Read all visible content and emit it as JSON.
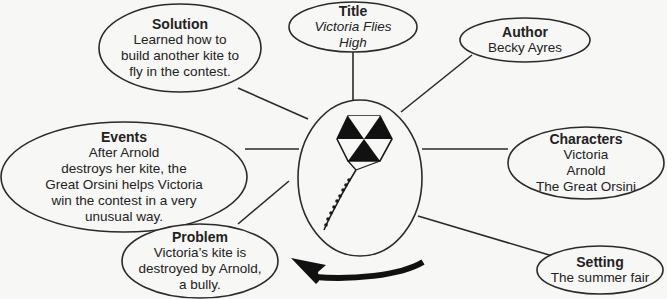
{
  "diagram": {
    "type": "story-map",
    "colors": {
      "stroke": "#2a2a2a",
      "background": "#f7f7f5",
      "text": "#222222"
    },
    "center": {
      "icon": "kite-icon"
    },
    "nodes": {
      "title": {
        "heading": "Title",
        "body": "Victoria Flies\nHigh"
      },
      "author": {
        "heading": "Author",
        "body": "Becky Ayres"
      },
      "solution": {
        "heading": "Solution",
        "body": "Learned how to\nbuild another kite to\nfly in the contest."
      },
      "events": {
        "heading": "Events",
        "body": "After Arnold\ndestroys her kite, the\nGreat Orsini helps Victoria\nwin the contest in a very\nunusual way."
      },
      "characters": {
        "heading": "Characters",
        "body": "Victoria\nArnold\nThe Great Orsini"
      },
      "problem": {
        "heading": "Problem",
        "body": "Victoria’s kite is\ndestroyed by Arnold,\na bully."
      },
      "setting": {
        "heading": "Setting",
        "body": "The summer fair"
      }
    },
    "arrow": {
      "direction": "counterclockwise",
      "icon": "curved-arrow-icon"
    }
  }
}
